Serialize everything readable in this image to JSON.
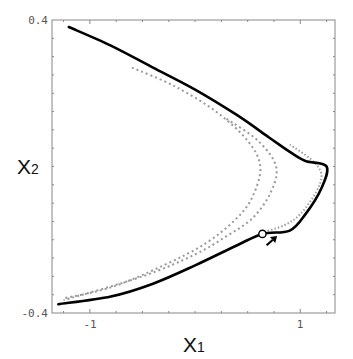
{
  "chart_data": {
    "type": "line",
    "title": "",
    "xlabel": "X1",
    "ylabel": "X2",
    "xlim": [
      -1.36,
      1.33
    ],
    "ylim": [
      -0.4,
      0.4
    ],
    "grid": false,
    "legend": null,
    "x_ticks": [
      {
        "value": -1,
        "label": "-1"
      },
      {
        "value": 1,
        "label": "1"
      }
    ],
    "y_ticks": [
      {
        "value": 0.4,
        "label": "0.4"
      },
      {
        "value": -0.4,
        "label": "-0.4"
      }
    ],
    "series": [
      {
        "name": "solid-curve",
        "style": "solid",
        "color": "#000000",
        "points": [
          [
            -1.2,
            0.381
          ],
          [
            -0.8,
            0.33
          ],
          [
            -0.4,
            0.27
          ],
          [
            0.0,
            0.21
          ],
          [
            0.4,
            0.14
          ],
          [
            0.7,
            0.08
          ],
          [
            0.9,
            0.04
          ],
          [
            1.05,
            0.015
          ],
          [
            1.25,
            0.0
          ],
          [
            1.2,
            -0.06
          ],
          [
            1.05,
            -0.13
          ],
          [
            0.9,
            -0.175
          ],
          [
            0.64,
            -0.184
          ],
          [
            0.4,
            -0.215
          ],
          [
            0.0,
            -0.27
          ],
          [
            -0.4,
            -0.32
          ],
          [
            -0.8,
            -0.355
          ],
          [
            -1.3,
            -0.376
          ]
        ]
      },
      {
        "name": "dotted-inner-curve",
        "style": "dotted",
        "color": "#999999",
        "points": [
          [
            -0.6,
            0.27
          ],
          [
            -0.2,
            0.22
          ],
          [
            0.2,
            0.15
          ],
          [
            0.5,
            0.07
          ],
          [
            0.62,
            0.0
          ],
          [
            0.55,
            -0.08
          ],
          [
            0.4,
            -0.14
          ],
          [
            0.1,
            -0.21
          ],
          [
            -0.3,
            -0.27
          ],
          [
            -0.8,
            -0.33
          ],
          [
            -1.25,
            -0.36
          ]
        ]
      },
      {
        "name": "dotted-middle-curve",
        "style": "dotted",
        "color": "#999999",
        "points": [
          [
            0.3,
            0.13
          ],
          [
            0.6,
            0.07
          ],
          [
            0.77,
            0.0
          ],
          [
            0.72,
            -0.07
          ],
          [
            0.55,
            -0.14
          ],
          [
            0.3,
            -0.19
          ],
          [
            0.0,
            -0.24
          ],
          [
            -0.5,
            -0.3
          ],
          [
            -1.25,
            -0.365
          ]
        ]
      },
      {
        "name": "dotted-outer-curve",
        "style": "dotted",
        "color": "#999999",
        "points": [
          [
            0.9,
            0.06
          ],
          [
            1.1,
            0.02
          ],
          [
            1.2,
            -0.02
          ],
          [
            1.15,
            -0.07
          ],
          [
            1.0,
            -0.13
          ],
          [
            0.85,
            -0.16
          ],
          [
            0.64,
            -0.18
          ]
        ]
      }
    ],
    "annotations": [
      {
        "type": "open-circle-marker",
        "x": 0.64,
        "y": -0.184
      },
      {
        "type": "arrow",
        "from": [
          0.68,
          -0.215
        ],
        "to": [
          0.78,
          -0.19
        ],
        "direction": "up-right"
      }
    ]
  },
  "labels": {
    "x_axis_main": "X",
    "x_axis_sub": "1",
    "y_axis_main": "X",
    "y_axis_sub": "2",
    "y_tick_top": "0.4",
    "y_tick_bottom": "-0.4",
    "x_tick_left": "-1",
    "x_tick_right": "1"
  },
  "colors": {
    "frame": "#777777",
    "solid_curve": "#000000",
    "dotted_curve": "#999999"
  }
}
